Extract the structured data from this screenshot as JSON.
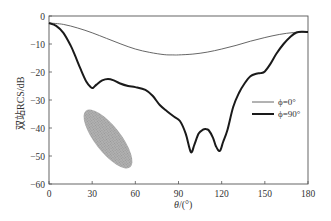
{
  "chart_data": {
    "type": "line",
    "title": "",
    "xlabel": "θ/(°)",
    "ylabel": "双站RCS/dB",
    "xlim": [
      0,
      180
    ],
    "ylim": [
      -60,
      0
    ],
    "xticks": [
      0,
      30,
      60,
      90,
      120,
      150,
      180
    ],
    "yticks": [
      0,
      -10,
      -20,
      -30,
      -40,
      -50,
      -60
    ],
    "grid": false,
    "legend_position": "center-right",
    "legend": [
      "ϕ=0°",
      "ϕ=90°"
    ],
    "annotations": [
      "inset: grey meshed ellipsoid target model"
    ],
    "series": [
      {
        "name": "ϕ=0°",
        "style": "thin",
        "x": [
          0,
          10,
          20,
          30,
          40,
          50,
          60,
          70,
          80,
          86,
          90,
          100,
          110,
          120,
          130,
          140,
          150,
          160,
          170,
          180
        ],
        "y": [
          -2.5,
          -3.0,
          -4.3,
          -6.0,
          -8.0,
          -10.0,
          -11.8,
          -13.0,
          -13.8,
          -13.9,
          -13.9,
          -13.6,
          -12.9,
          -11.8,
          -10.5,
          -9.0,
          -7.7,
          -6.6,
          -5.9,
          -5.7
        ]
      },
      {
        "name": "ϕ=90°",
        "style": "thick",
        "x": [
          0,
          5,
          10,
          15,
          18,
          22,
          26,
          29,
          30.5,
          33,
          37,
          41,
          45,
          49,
          55,
          60,
          67,
          72,
          77,
          82,
          87,
          91,
          95,
          98.6,
          101,
          104,
          107,
          109,
          111,
          114,
          116,
          118.7,
          121,
          124,
          128,
          132,
          136,
          140,
          144,
          147,
          150,
          154,
          158,
          163,
          168,
          172,
          176,
          180
        ],
        "y": [
          -2.5,
          -3.5,
          -6.0,
          -10.5,
          -14.0,
          -19.0,
          -23.5,
          -25.4,
          -25.7,
          -24.5,
          -23.0,
          -22.5,
          -23.0,
          -24.0,
          -25.0,
          -25.4,
          -26.4,
          -28.5,
          -31.8,
          -34.0,
          -36.0,
          -37.5,
          -42.0,
          -48.6,
          -46.0,
          -42.0,
          -40.6,
          -40.4,
          -40.8,
          -43.5,
          -46.5,
          -48.2,
          -45.0,
          -40.7,
          -32.5,
          -27.5,
          -24.0,
          -21.5,
          -20.6,
          -20.4,
          -19.8,
          -17.0,
          -13.5,
          -10.0,
          -7.3,
          -5.9,
          -5.6,
          -5.7
        ]
      }
    ]
  },
  "axes": {
    "xlabel_theta": "θ",
    "xlabel_unit": "/(°)",
    "ylabel": "双站RCS/dB"
  },
  "legend": {
    "items": [
      {
        "label": "ϕ=0°",
        "stroke_width": 0.9
      },
      {
        "label": "ϕ=90°",
        "stroke_width": 2.0
      }
    ]
  },
  "colors": {
    "axis": "#555555",
    "thin_line": "#555555",
    "thick_line": "#1a1a1a",
    "inset": "#9a9a9a"
  }
}
